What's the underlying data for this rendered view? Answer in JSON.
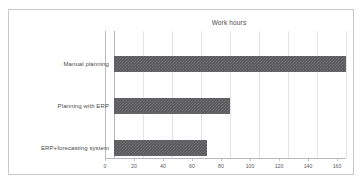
{
  "chart_data": {
    "type": "bar",
    "orientation": "horizontal",
    "title": "Work hours",
    "xlabel": "",
    "ylabel": "",
    "categories": [
      "Manual planning",
      "Planning with ERP",
      "ERP+forecasting system"
    ],
    "values": [
      160,
      80,
      64
    ],
    "xlim": [
      0,
      160
    ],
    "xticks": [
      0,
      20,
      40,
      60,
      80,
      100,
      120,
      140,
      160
    ],
    "xtick_labels": [
      "0",
      "20",
      "40",
      "60",
      "80",
      "100",
      "120",
      "140",
      "160"
    ],
    "grid": true,
    "legend": false,
    "series": [
      {
        "name": "Work hours",
        "values": [
          160,
          80,
          64
        ]
      }
    ],
    "colors": {
      "bar": "#59595b",
      "gridline": "#e4e4e4",
      "axis": "#b9b9b9",
      "frame": "#c8c8c8",
      "text": "#4a4a4a",
      "background": "#ffffff"
    }
  }
}
